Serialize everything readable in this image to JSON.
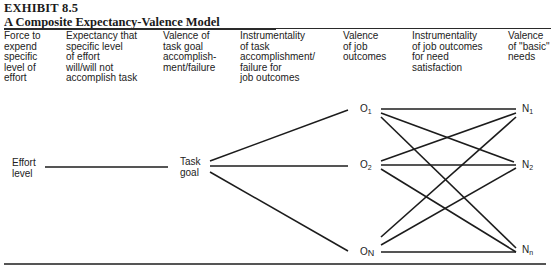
{
  "exhibit": {
    "label": "EXHIBIT 8.5",
    "title": "A Composite Expectancy-Valence Model"
  },
  "columns": [
    {
      "id": "force",
      "text": "Force to\nexpend\nspecific\nlevel of\neffort"
    },
    {
      "id": "expectancy",
      "text": "Expectancy that\nspecific level\nof effort\nwill/will not\naccomplish task"
    },
    {
      "id": "valence-task",
      "text": "Valence of\ntask goal\naccomplish-\nment/failure"
    },
    {
      "id": "instrumentality-task",
      "text": "Instrumentality\nof task\naccomplishment/\nfailure for\njob outcomes"
    },
    {
      "id": "valence-job",
      "text": "Valence\nof job\noutcomes"
    },
    {
      "id": "instrumentality-job",
      "text": "Instrumentality\nof job outcomes\nfor need\nsatisfaction"
    },
    {
      "id": "valence-needs",
      "text": "Valence\nof \"basic\"\nneeds"
    }
  ],
  "nodes": {
    "effort": {
      "line1": "Effort",
      "line2": "level"
    },
    "task": {
      "line1": "Task",
      "line2": "goal"
    },
    "outcomes": [
      {
        "base": "O",
        "sub": "1"
      },
      {
        "base": "O",
        "sub": "2"
      },
      {
        "base": "O",
        "sub": "N"
      }
    ],
    "needs": [
      {
        "base": "N",
        "sub": "1"
      },
      {
        "base": "N",
        "sub": "2"
      },
      {
        "base": "N",
        "sub": "n"
      }
    ]
  },
  "connections": [
    [
      "Effort level",
      "Task goal"
    ],
    [
      "Task goal",
      "O1"
    ],
    [
      "Task goal",
      "O2"
    ],
    [
      "Task goal",
      "ON"
    ],
    [
      "O1",
      "N1"
    ],
    [
      "O1",
      "N2"
    ],
    [
      "O1",
      "Nn"
    ],
    [
      "O2",
      "N1"
    ],
    [
      "O2",
      "N2"
    ],
    [
      "O2",
      "Nn"
    ],
    [
      "ON",
      "N1"
    ],
    [
      "ON",
      "N2"
    ],
    [
      "ON",
      "Nn"
    ]
  ]
}
